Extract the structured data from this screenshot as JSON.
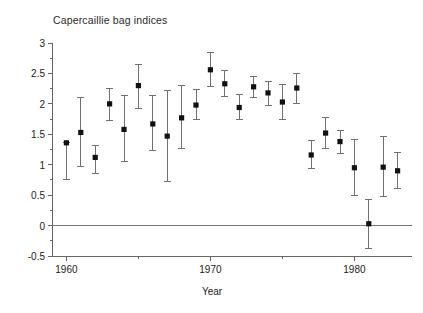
{
  "chart_data": {
    "type": "scatter",
    "title": "Capercaillie bag indices",
    "xlabel": "Year",
    "ylabel": "",
    "xlim": [
      1959.0,
      1984.0
    ],
    "ylim": [
      -0.5,
      3.0
    ],
    "grid": false,
    "legend": null,
    "marker": "filled-square",
    "error_bars": "vertical",
    "zero_line": 0,
    "x_major_ticks": [
      1960,
      1970,
      1980
    ],
    "x_major_tick_labels": [
      "1960",
      "1970",
      "1980"
    ],
    "x_minor_ticks": [
      1965,
      1975
    ],
    "y_ticks": [
      -0.5,
      0,
      0.5,
      1,
      1.5,
      2,
      2.5,
      3
    ],
    "y_tick_labels": [
      "-0.5",
      "0",
      "0.5",
      "1",
      "1.5",
      "2",
      "2.5",
      "3"
    ],
    "x": [
      1960,
      1961,
      1962,
      1963,
      1964,
      1965,
      1966,
      1967,
      1968,
      1969,
      1970,
      1971,
      1972,
      1973,
      1974,
      1975,
      1976,
      1977,
      1978,
      1979,
      1980,
      1981,
      1982,
      1983
    ],
    "values": [
      1.36,
      1.53,
      1.12,
      2.0,
      1.58,
      2.3,
      1.67,
      1.47,
      1.77,
      1.98,
      2.56,
      2.33,
      1.94,
      2.28,
      2.18,
      2.03,
      2.26,
      1.16,
      1.52,
      1.38,
      0.95,
      0.03,
      0.96,
      0.9
    ],
    "y_lower": [
      0.75,
      0.97,
      0.86,
      1.72,
      1.06,
      1.93,
      1.24,
      0.73,
      1.26,
      1.74,
      2.29,
      2.12,
      1.74,
      2.1,
      1.98,
      1.74,
      2.01,
      0.94,
      1.27,
      1.18,
      0.5,
      -0.37,
      0.47,
      0.61
    ],
    "y_upper": [
      1.36,
      2.1,
      1.32,
      2.26,
      2.13,
      2.65,
      2.13,
      2.22,
      2.3,
      2.23,
      2.84,
      2.55,
      2.15,
      2.45,
      2.37,
      2.32,
      2.5,
      1.39,
      1.77,
      1.57,
      1.41,
      0.43,
      1.46,
      1.2
    ]
  },
  "axis_style": {
    "axis_color": "#666666",
    "marker_color": "#111111",
    "errorbar_color": "#707070",
    "zero_line_color": "#777777",
    "text_color": "#222222"
  }
}
